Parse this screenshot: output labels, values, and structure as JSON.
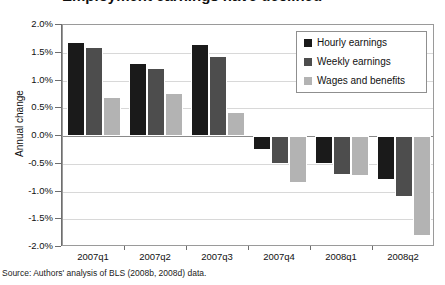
{
  "title": "Employment earnings have declined",
  "source_note": "Source: Authors' analysis of BLS (2008b, 2008d) data.",
  "axis": {
    "y_title": "Annual change",
    "y_ticks": [
      "2.0%",
      "1.5%",
      "1.0%",
      "0.5%",
      "0.0%",
      "-0.5%",
      "-1.0%",
      "-1.5%",
      "-2.0%"
    ]
  },
  "legend": {
    "items": [
      {
        "label": "Hourly earnings",
        "color": "#1a1a1a"
      },
      {
        "label": "Weekly earnings",
        "color": "#4d4d4d"
      },
      {
        "label": "Wages and benefits",
        "color": "#b3b3b3"
      }
    ]
  },
  "chart_data": {
    "type": "bar",
    "title": "Employment earnings have declined",
    "xlabel": "",
    "ylabel": "Annual change",
    "ylim": [
      -2.0,
      2.0
    ],
    "ytick_step": 0.5,
    "grid": true,
    "legend_position": "top-right",
    "value_unit": "percent",
    "categories": [
      "2007q1",
      "2007q2",
      "2007q3",
      "2007q4",
      "2008q1",
      "2008q2"
    ],
    "series": [
      {
        "name": "Hourly earnings",
        "color": "#1a1a1a",
        "values": [
          1.7,
          1.32,
          1.65,
          -0.25,
          -0.5,
          -0.8
        ]
      },
      {
        "name": "Weekly earnings",
        "color": "#4d4d4d",
        "values": [
          1.6,
          1.22,
          1.45,
          -0.5,
          -0.7,
          -1.1
        ]
      },
      {
        "name": "Wages and benefits",
        "color": "#b3b3b3",
        "values": [
          0.7,
          0.77,
          0.43,
          -0.85,
          -0.72,
          -1.8
        ]
      }
    ]
  }
}
